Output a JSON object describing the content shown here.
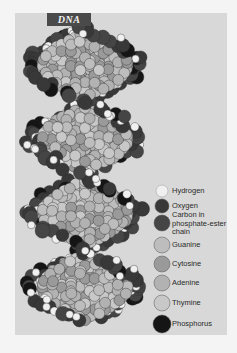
{
  "title": "DNA",
  "colors": {
    "page_background": "#f4f4f4",
    "panel_background": "#d8d8d8",
    "title_box": "#4a4a4a",
    "hydrogen": "#f0f0f0",
    "oxygen": "#383838",
    "carbon": "#454545",
    "guanine": "#bdbdbd",
    "cytosine": "#9a9a9a",
    "adenine": "#b2b2b2",
    "thymine": "#c8c8c8",
    "phosphorus": "#151515"
  },
  "legend": {
    "items": [
      {
        "key": "hydrogen",
        "label": "Hydrogen",
        "cy": 191,
        "r": 6
      },
      {
        "key": "oxygen",
        "label": "Oxygen",
        "cy": 206,
        "r": 7
      },
      {
        "key": "carbon",
        "label": "Carbon in phosphate-ester chain",
        "cy": 223,
        "r": 8
      },
      {
        "key": "guanine",
        "label": "Guanine",
        "cy": 245,
        "r": 8
      },
      {
        "key": "cytosine",
        "label": "Cytosine",
        "cy": 264,
        "r": 8
      },
      {
        "key": "adenine",
        "label": "Adenine",
        "cy": 283,
        "r": 8
      },
      {
        "key": "thymine",
        "label": "Thymine",
        "cy": 303,
        "r": 8
      },
      {
        "key": "phosphorus",
        "label": "Phosphorus",
        "cy": 324,
        "r": 9
      }
    ]
  },
  "legend_labels": {
    "hydrogen": "Hydrogen",
    "oxygen": "Oxygen",
    "carbon_line1": "Carbon in",
    "carbon_line2": "phosphate-ester",
    "carbon_line3": "chain",
    "guanine": "Guanine",
    "cytosine": "Cytosine",
    "adenine": "Adenine",
    "thymine": "Thymine",
    "phosphorus": "Phosphorus"
  }
}
